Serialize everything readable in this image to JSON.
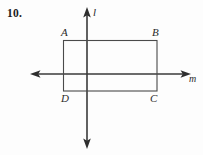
{
  "figure": {
    "problem_number": "10.",
    "labels": {
      "vertex_a": "A",
      "vertex_b": "B",
      "vertex_c": "C",
      "vertex_d": "D",
      "line_l": "l",
      "line_m": "m"
    },
    "colors": {
      "background": "#fdfdfd",
      "stroke": "#3a3a3a",
      "rect_stroke": "#4a4a4a",
      "text": "#1b1b1b"
    },
    "geometry": {
      "rectangle": {
        "x": 63,
        "y": 40,
        "width": 94,
        "height": 51
      },
      "vertical_line_l": {
        "x": 87,
        "y_top": 8,
        "y_bottom": 148
      },
      "horizontal_line_m": {
        "y": 74,
        "x_left": 31,
        "x_right": 190
      }
    }
  }
}
